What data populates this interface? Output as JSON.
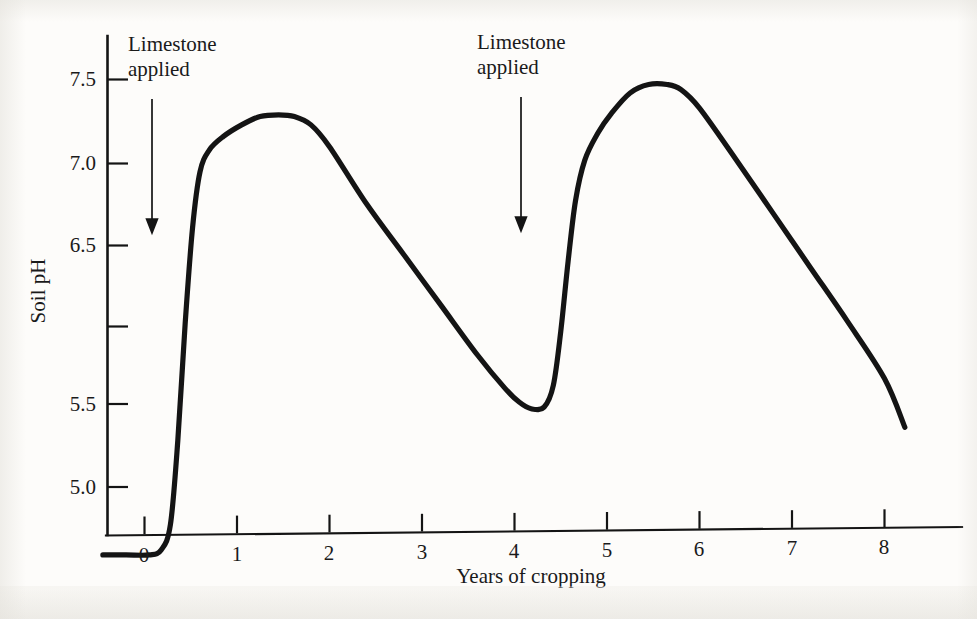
{
  "figure": {
    "background_color": "#fdfcfa",
    "ink_color": "#141414"
  },
  "chart_data": {
    "type": "line",
    "title": "",
    "subtitle": "",
    "xlabel": "Years of cropping",
    "ylabel": "Soil pH",
    "xlim": [
      -0.45,
      9.2
    ],
    "ylim": [
      4.25,
      7.82
    ],
    "grid": false,
    "legend": null,
    "x_ticks": [
      0,
      1,
      2,
      3,
      4,
      5,
      6,
      7,
      8
    ],
    "x_tick_labels": [
      "0",
      "1",
      "2",
      "3",
      "4",
      "5",
      "6",
      "7",
      "8"
    ],
    "y_ticks": [
      7.5,
      7.0,
      6.5,
      5.5,
      5.0,
      4.5
    ],
    "y_tick_labels": [
      "7.5",
      "7.0",
      "6.5",
      "",
      "5.5",
      "5.0",
      ""
    ],
    "y_labeled_ticks": [
      {
        "value": 7.5,
        "label": "7.5"
      },
      {
        "value": 7.0,
        "label": "7.0"
      },
      {
        "value": 6.5,
        "label": "6.5"
      },
      {
        "value": 6.0,
        "label": ""
      },
      {
        "value": 5.5,
        "label": "5.5"
      },
      {
        "value": 5.0,
        "label": "5.0"
      },
      {
        "value": 4.5,
        "label": ""
      }
    ],
    "series": [
      {
        "name": "Soil pH",
        "points": [
          {
            "x": -0.45,
            "y": 4.67
          },
          {
            "x": -0.2,
            "y": 4.67
          },
          {
            "x": 0.05,
            "y": 4.67
          },
          {
            "x": 0.18,
            "y": 4.7
          },
          {
            "x": 0.28,
            "y": 4.85
          },
          {
            "x": 0.36,
            "y": 5.35
          },
          {
            "x": 0.44,
            "y": 6.05
          },
          {
            "x": 0.52,
            "y": 6.62
          },
          {
            "x": 0.6,
            "y": 6.95
          },
          {
            "x": 0.7,
            "y": 7.08
          },
          {
            "x": 0.85,
            "y": 7.16
          },
          {
            "x": 1.05,
            "y": 7.23
          },
          {
            "x": 1.25,
            "y": 7.28
          },
          {
            "x": 1.45,
            "y": 7.29
          },
          {
            "x": 1.62,
            "y": 7.28
          },
          {
            "x": 1.8,
            "y": 7.23
          },
          {
            "x": 2.0,
            "y": 7.1
          },
          {
            "x": 2.4,
            "y": 6.76
          },
          {
            "x": 2.8,
            "y": 6.46
          },
          {
            "x": 3.2,
            "y": 6.16
          },
          {
            "x": 3.6,
            "y": 5.86
          },
          {
            "x": 3.9,
            "y": 5.66
          },
          {
            "x": 4.05,
            "y": 5.58
          },
          {
            "x": 4.18,
            "y": 5.54
          },
          {
            "x": 4.32,
            "y": 5.55
          },
          {
            "x": 4.42,
            "y": 5.68
          },
          {
            "x": 4.5,
            "y": 6.0
          },
          {
            "x": 4.58,
            "y": 6.42
          },
          {
            "x": 4.66,
            "y": 6.78
          },
          {
            "x": 4.76,
            "y": 7.02
          },
          {
            "x": 4.9,
            "y": 7.18
          },
          {
            "x": 5.05,
            "y": 7.3
          },
          {
            "x": 5.25,
            "y": 7.42
          },
          {
            "x": 5.45,
            "y": 7.47
          },
          {
            "x": 5.65,
            "y": 7.47
          },
          {
            "x": 5.8,
            "y": 7.44
          },
          {
            "x": 6.0,
            "y": 7.33
          },
          {
            "x": 6.4,
            "y": 7.02
          },
          {
            "x": 6.8,
            "y": 6.7
          },
          {
            "x": 7.2,
            "y": 6.38
          },
          {
            "x": 7.6,
            "y": 6.06
          },
          {
            "x": 8.0,
            "y": 5.72
          },
          {
            "x": 8.22,
            "y": 5.43
          }
        ]
      }
    ],
    "annotations": [
      {
        "id": "limestone-1",
        "text_line1": "Limestone",
        "text_line2": "applied",
        "arrow_x": 0.1,
        "arrow_y_top": 7.35,
        "arrow_y_bottom": 6.55
      },
      {
        "id": "limestone-2",
        "text_line1": "Limestone",
        "text_line2": "applied",
        "arrow_x": 4.08,
        "arrow_y_top": 7.37,
        "arrow_y_bottom": 6.57
      }
    ]
  },
  "axes": {
    "y_title": "Soil pH",
    "x_title": "Years of cropping"
  },
  "annotation_labels": {
    "first": {
      "line1": "Limestone",
      "line2": "applied"
    },
    "second": {
      "line1": "Limestone",
      "line2": "applied"
    }
  },
  "x_tick_labels": {
    "t0": "0",
    "t1": "1",
    "t2": "2",
    "t3": "3",
    "t4": "4",
    "t5": "5",
    "t6": "6",
    "t7": "7",
    "t8": "8"
  },
  "y_tick_labels": {
    "t75": "7.5",
    "t70": "7.0",
    "t65": "6.5",
    "t55": "5.5",
    "t50": "5.0"
  }
}
